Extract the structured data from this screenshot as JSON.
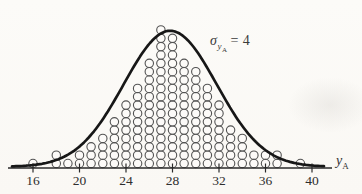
{
  "figure": {
    "background": "#fbf9f5",
    "ink_color": "#2a2a2a",
    "circle_stroke": "#525252",
    "curve_color": "#171717"
  },
  "annotation": {
    "sigma": "σ",
    "sub": "y",
    "subsub": "A",
    "equals": "= 4"
  },
  "x_axis": {
    "label_main": "y",
    "label_sub": "A",
    "ticks": [
      16,
      20,
      24,
      28,
      32,
      36,
      40
    ]
  },
  "chart_data": {
    "type": "bar",
    "style": "dot-histogram (stacked open circles) with overlaid normal curve",
    "title": "",
    "xlabel": "y_A",
    "ylabel": "",
    "annotation": "σ_yA = 4",
    "categories": [
      16,
      17,
      18,
      19,
      20,
      21,
      22,
      23,
      24,
      25,
      26,
      27,
      28,
      29,
      30,
      31,
      32,
      33,
      34,
      35,
      36,
      37,
      38,
      39
    ],
    "values": [
      1,
      0,
      2,
      1,
      2,
      3,
      4,
      6,
      8,
      10,
      13,
      17,
      16,
      13,
      12,
      10,
      8,
      5,
      4,
      2,
      2,
      2,
      0,
      1
    ],
    "x_ticks": [
      16,
      20,
      24,
      28,
      32,
      36,
      40
    ],
    "xlim": [
      14.5,
      41.5
    ],
    "grid": false,
    "legend": "none",
    "overlay_curve": {
      "shape": "normal",
      "mean": 27.8,
      "sigma": 4
    }
  }
}
